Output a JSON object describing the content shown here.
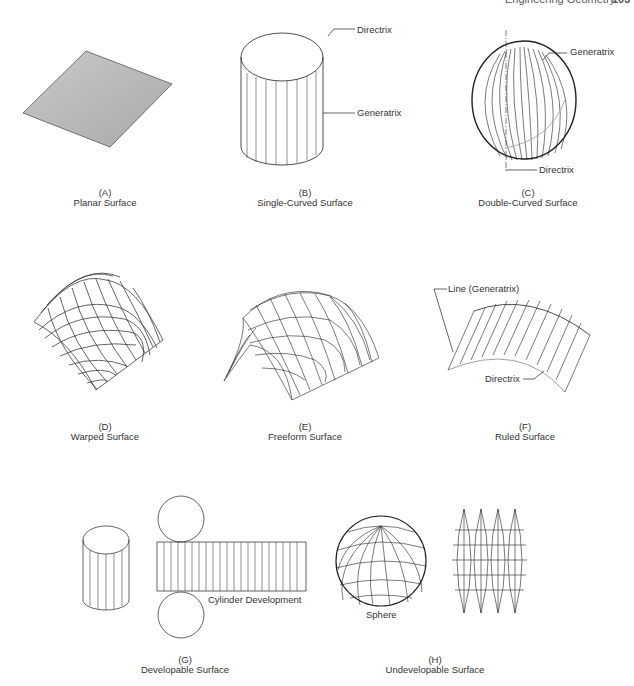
{
  "running_header": {
    "title": "Engineering Geometry",
    "page": "103"
  },
  "figures": [
    {
      "letter": "(A)",
      "name": "Planar Surface"
    },
    {
      "letter": "(B)",
      "name": "Single-Curved Surface"
    },
    {
      "letter": "(C)",
      "name": "Double-Curved Surface"
    },
    {
      "letter": "(D)",
      "name": "Warped Surface"
    },
    {
      "letter": "(E)",
      "name": "Freeform Surface"
    },
    {
      "letter": "(F)",
      "name": "Ruled Surface"
    },
    {
      "letter": "(G)",
      "name": "Developable Surface"
    },
    {
      "letter": "(H)",
      "name": "Undevelopable Surface"
    }
  ],
  "callouts": {
    "b_directrix": "Directrix",
    "b_generatrix": "Generatrix",
    "c_generatrix": "Generatrix",
    "c_directrix": "Directrix",
    "f_line": "Line (Generatrix)",
    "f_directrix": "Directrix",
    "g_development": "Cylinder Development",
    "h_sphere": "Sphere"
  }
}
